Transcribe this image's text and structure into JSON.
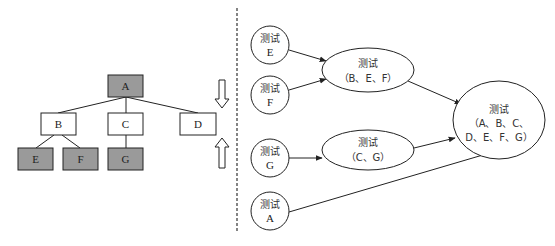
{
  "tree": {
    "nodes": [
      {
        "id": "A",
        "label": "A",
        "x": 108,
        "y": 75,
        "shaded": true
      },
      {
        "id": "B",
        "label": "B",
        "x": 41,
        "y": 113,
        "shaded": false
      },
      {
        "id": "C",
        "label": "C",
        "x": 108,
        "y": 113,
        "shaded": false
      },
      {
        "id": "D",
        "label": "D",
        "x": 180,
        "y": 113,
        "shaded": false
      },
      {
        "id": "E",
        "label": "E",
        "x": 18,
        "y": 148,
        "shaded": true
      },
      {
        "id": "F",
        "label": "F",
        "x": 63,
        "y": 148,
        "shaded": true
      },
      {
        "id": "G",
        "label": "G",
        "x": 108,
        "y": 148,
        "shaded": true
      }
    ],
    "edges": [
      [
        "A",
        "B"
      ],
      [
        "A",
        "C"
      ],
      [
        "A",
        "D"
      ],
      [
        "B",
        "E"
      ],
      [
        "B",
        "F"
      ],
      [
        "C",
        "G"
      ]
    ]
  },
  "arrows": {
    "down": "hollow-down-arrow",
    "up": "hollow-up-arrow"
  },
  "flow": {
    "circles": [
      {
        "id": "tE",
        "line1": "测试",
        "line2": "E",
        "cx": 270,
        "cy": 45
      },
      {
        "id": "tF",
        "line1": "测试",
        "line2": "F",
        "cx": 270,
        "cy": 95
      },
      {
        "id": "tG",
        "line1": "测试",
        "line2": "G",
        "cx": 270,
        "cy": 158
      },
      {
        "id": "tA",
        "line1": "测试",
        "line2": "A",
        "cx": 270,
        "cy": 210
      }
    ],
    "ellipses": [
      {
        "id": "tBEF",
        "line1": "测试",
        "line2": "（B、E、F）"
      },
      {
        "id": "tCG",
        "line1": "测试",
        "line2": "（C、G）"
      },
      {
        "id": "tAll",
        "line1": "测试",
        "line2": "（A、B、C、",
        "line3": "D、E、F、G）"
      }
    ]
  },
  "colors": {
    "shaded": "#9a9a9a",
    "stroke": "#222222",
    "background": "#ffffff",
    "divider": "#333333"
  }
}
